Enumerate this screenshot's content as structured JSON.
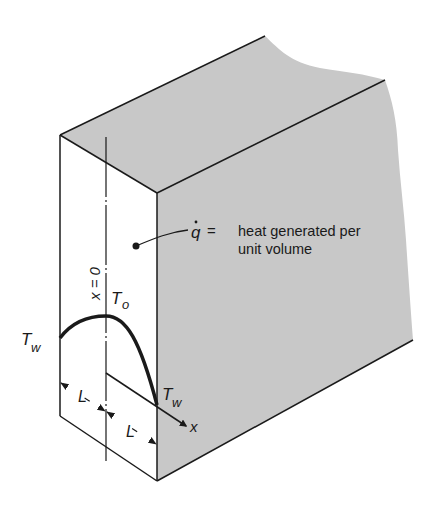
{
  "diagram": {
    "type": "slab-heat-generation",
    "colors": {
      "background": "#ffffff",
      "shaded_face": "#c8c8c8",
      "stroke": "#1a1a1a"
    },
    "labels": {
      "q_dot_symbol": "q",
      "equals": "=",
      "q_description_line1": "heat generated per",
      "q_description_line2": "unit volume",
      "center_plane": "x = 0",
      "center_temp_T": "T",
      "center_temp_sub": "o",
      "wall_temp_left_T": "T",
      "wall_temp_left_sub": "w",
      "wall_temp_right_T": "T",
      "wall_temp_right_sub": "w",
      "half_thickness_left": "L",
      "half_thickness_right": "L",
      "axis": "x"
    }
  }
}
